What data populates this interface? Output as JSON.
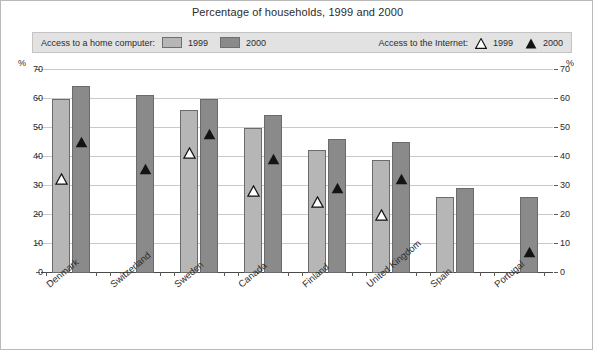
{
  "title": "Percentage of households, 1999 and 2000",
  "legend": {
    "computer": {
      "label": "Access to a home computer:",
      "entries": [
        {
          "name": "1999",
          "swatch": "light-square-swatch"
        },
        {
          "name": "2000",
          "swatch": "dark-square-swatch"
        }
      ]
    },
    "internet": {
      "label": "Access to the Internet:",
      "entries": [
        {
          "name": "1999",
          "swatch": "open-triangle-marker"
        },
        {
          "name": "2000",
          "swatch": "filled-triangle-marker"
        }
      ]
    }
  },
  "axis": {
    "unit_symbol_left": "%",
    "unit_symbol_right": "%",
    "ticks": [
      "70",
      "60",
      "50",
      "40",
      "30",
      "20",
      "10",
      "0"
    ]
  },
  "colors": {
    "bar_1999": "#b6b6b6",
    "bar_2000": "#8a8a8a",
    "marker_1999": "#ffffff",
    "marker_2000": "#131313",
    "gridline": "#c9c9c9",
    "legend_band": "#e2e2e2",
    "frame": "#b9b9b9"
  },
  "chart_data": {
    "type": "bar",
    "title": "Percentage of households, 1999 and 2000",
    "xlabel": "",
    "ylabel": "%",
    "ylim": [
      0,
      70
    ],
    "yticks": [
      0,
      10,
      20,
      30,
      40,
      50,
      60,
      70
    ],
    "grid": true,
    "legend_position": "top",
    "categories": [
      "Denmark",
      "Switzerland",
      "Sweden",
      "Canada",
      "Finland",
      "United Kingdom",
      "Spain",
      "Portugal"
    ],
    "series": [
      {
        "name": "Access to a home computer: 1999",
        "type": "bar",
        "values": [
          59.5,
          null,
          56,
          49.5,
          42,
          38.5,
          26,
          null
        ]
      },
      {
        "name": "Access to a home computer: 2000",
        "type": "bar",
        "values": [
          64,
          61,
          59.5,
          54,
          46,
          45,
          29,
          26
        ]
      },
      {
        "name": "Access to the Internet: 1999",
        "type": "marker-open-triangle",
        "values": [
          32,
          null,
          41,
          28,
          24,
          19.5,
          null,
          null
        ]
      },
      {
        "name": "Access to the Internet: 2000",
        "type": "marker-filled-triangle",
        "values": [
          45,
          35.5,
          47.5,
          39,
          29,
          32,
          null,
          7
        ]
      }
    ]
  }
}
